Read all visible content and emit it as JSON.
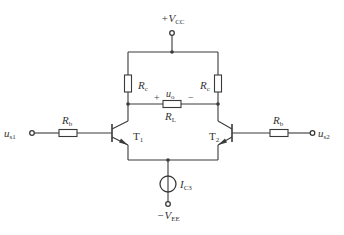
{
  "diagram": {
    "type": "circuit-schematic",
    "colors": {
      "line": "#3a3a3a",
      "text": "#333333",
      "background": "#ffffff"
    },
    "supply": {
      "positive": {
        "prefix": "+V",
        "sub": "CC"
      },
      "negative": {
        "prefix": "−V",
        "sub": "EE"
      }
    },
    "resistors": {
      "rc_left": {
        "name": "R",
        "sub": "c"
      },
      "rc_right": {
        "name": "R",
        "sub": "c"
      },
      "rl": {
        "name": "R",
        "sub": "L"
      },
      "rb_left": {
        "name": "R",
        "sub": "b"
      },
      "rb_right": {
        "name": "R",
        "sub": "b"
      }
    },
    "output": {
      "name": "u",
      "sub": "o",
      "plus": "+",
      "minus": "−"
    },
    "transistors": {
      "t1": {
        "name": "T",
        "sub": "1"
      },
      "t2": {
        "name": "T",
        "sub": "2"
      }
    },
    "inputs": {
      "left": {
        "name": "u",
        "sub": "s1"
      },
      "right": {
        "name": "u",
        "sub": "s2"
      }
    },
    "current_source": {
      "name": "I",
      "sub": "C3"
    }
  }
}
